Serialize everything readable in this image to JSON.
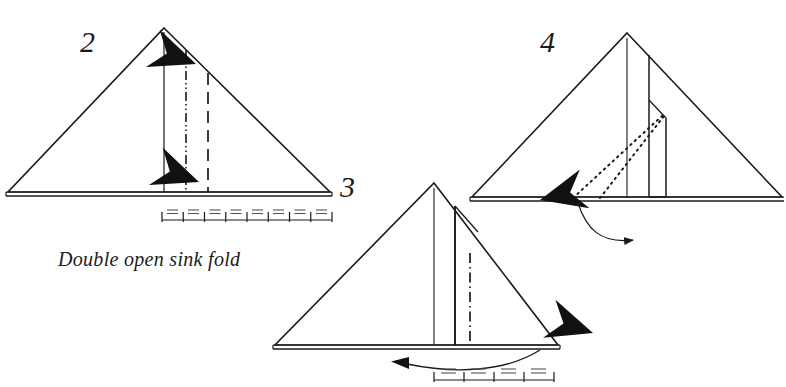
{
  "page": {
    "width": 786,
    "height": 387,
    "background_color": "#ffffff",
    "ink_color": "#1a1a1a"
  },
  "caption": {
    "text": "Double open sink fold"
  },
  "steps": [
    {
      "number": "2",
      "label_position": {
        "x": 80,
        "y": 27
      },
      "shape": "triangle",
      "apex": {
        "x": 164,
        "y": 28
      },
      "base_left": {
        "x": 8,
        "y": 192
      },
      "base_right": {
        "x": 330,
        "y": 192
      },
      "line_types": [
        "solid-fold",
        "dash-dot-dot-fold",
        "dashed-valley-fold"
      ],
      "arrows": [
        "push-arrow-upper",
        "push-arrow-lower"
      ],
      "scale_segments": 8,
      "scale_mark": "="
    },
    {
      "number": "3",
      "label_position": {
        "x": 340,
        "y": 172
      },
      "shape": "triangle",
      "apex": {
        "x": 434,
        "y": 183
      },
      "base_left": {
        "x": 275,
        "y": 345
      },
      "base_right": {
        "x": 558,
        "y": 345
      },
      "line_types": [
        "solid-fold",
        "solid-edge",
        "dash-dot-fold"
      ],
      "arrows": [
        "push-arrow-right",
        "curved-turn-arrow-left"
      ],
      "scale_segments": 4,
      "scale_mark": "="
    },
    {
      "number": "4",
      "label_position": {
        "x": 540,
        "y": 27
      },
      "shape": "triangle",
      "apex": {
        "x": 627,
        "y": 33
      },
      "base_left": {
        "x": 472,
        "y": 197
      },
      "base_right": {
        "x": 782,
        "y": 197
      },
      "line_types": [
        "solid-fold",
        "solid-edge",
        "dotted-hidden-fold"
      ],
      "arrows": [
        "push-arrow-right",
        "curved-unfold-arrow"
      ],
      "scale_segments": 0,
      "scale_mark": ""
    }
  ]
}
